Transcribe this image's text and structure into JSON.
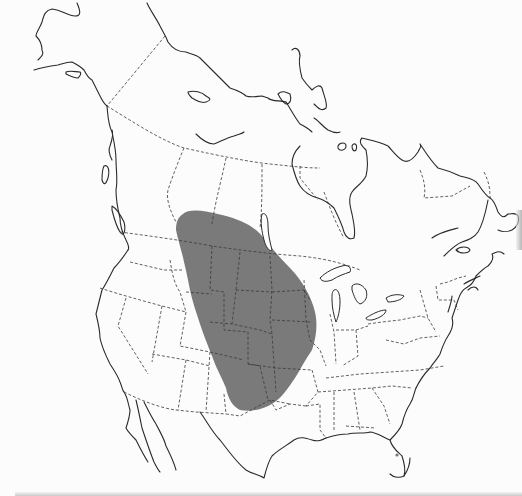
{
  "map": {
    "title": "",
    "region": "North America",
    "type": "species-range-map",
    "colors": {
      "background": "#fcfcfc",
      "coastline": "#2a2a2a",
      "political_border": "#3a3a3a",
      "range_fill": "#7a7a7a"
    },
    "range_label": "Range",
    "range_description": "Great Plains, from southern Alberta/Saskatchewan/Manitoba south to Texas and New Mexico",
    "legend": []
  }
}
